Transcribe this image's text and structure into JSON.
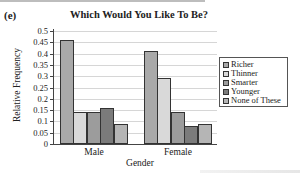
{
  "panel_label": "(e)",
  "chart_data": {
    "type": "bar",
    "title": "Which Would You Like To Be?",
    "xlabel": "Gender",
    "ylabel": "Relative Frequency",
    "categories": [
      "Male",
      "Female"
    ],
    "series": [
      {
        "name": "Richer",
        "values": [
          0.46,
          0.41
        ],
        "color": "#a9a9a9"
      },
      {
        "name": "Thinner",
        "values": [
          0.14,
          0.29
        ],
        "color": "#d9d9d9"
      },
      {
        "name": "Smarter",
        "values": [
          0.14,
          0.14
        ],
        "color": "#9c9c9c"
      },
      {
        "name": "Younger",
        "values": [
          0.16,
          0.08
        ],
        "color": "#7b7b7b"
      },
      {
        "name": "None of These",
        "values": [
          0.09,
          0.09
        ],
        "color": "#b5b5b5"
      }
    ],
    "ylim": [
      0,
      0.5
    ],
    "yticks": [
      "0",
      "0.05",
      "0.1",
      "0.15",
      "0.2",
      "0.25",
      "0.3",
      "0.35",
      "0.4",
      "0.45",
      "0.5"
    ],
    "grid": true,
    "legend_position": "right"
  }
}
